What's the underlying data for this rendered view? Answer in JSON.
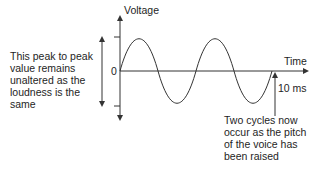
{
  "diagram": {
    "y_axis_label": "Voltage",
    "x_axis_label": "Time",
    "zero_label": "0",
    "period_marker_label": "10 ms",
    "left_annotation": [
      "This peak to peak",
      "value remains",
      "unaltered as the",
      "loudness is the",
      "same"
    ],
    "bottom_annotation": [
      "Two cycles now",
      "occur as the pitch",
      "of the voice has",
      "been raised"
    ],
    "wave": {
      "cycles": 2,
      "type": "sine",
      "duration_ms": 10
    }
  }
}
